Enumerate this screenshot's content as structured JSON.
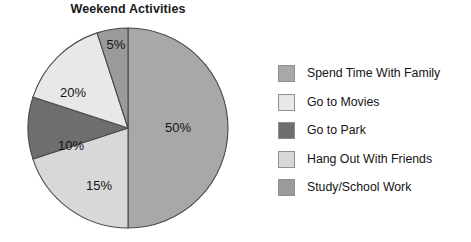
{
  "chart_data": {
    "type": "pie",
    "title": "Weekend Activities",
    "xlabel": "",
    "ylabel": "",
    "legend_position": "right",
    "grid": false,
    "categories": [
      "Spend Time With Family",
      "Go to Movies",
      "Go to Park",
      "Hang Out With Friends",
      "Study/School Work"
    ],
    "values": [
      50,
      15,
      10,
      20,
      5
    ],
    "value_labels": [
      "50%",
      "15%",
      "10%",
      "20%",
      "5%"
    ],
    "colors": [
      "#a8a8a8",
      "#e8e8e8",
      "#6e6e6e",
      "#d8d8d8",
      "#9a9a9a"
    ],
    "slice_order_clockwise_from_top": [
      "Spend Time With Family",
      "Hang Out With Friends",
      "Go to Park",
      "Go to Movies",
      "Study/School Work"
    ],
    "slices": [
      {
        "label": "Spend Time With Family",
        "value": 50,
        "display": "50%",
        "color": "#a8a8a8"
      },
      {
        "label": "Go to Movies",
        "value": 15,
        "display": "15%",
        "color": "#e8e8e8"
      },
      {
        "label": "Go to Park",
        "value": 10,
        "display": "10%",
        "color": "#6e6e6e"
      },
      {
        "label": "Hang Out With Friends",
        "value": 20,
        "display": "20%",
        "color": "#d8d8d8"
      },
      {
        "label": "Study/School Work",
        "value": 5,
        "display": "5%",
        "color": "#9a9a9a"
      }
    ]
  },
  "legend": {
    "items": [
      {
        "label": "Spend Time With Family",
        "color": "#a8a8a8"
      },
      {
        "label": "Go to Movies",
        "color": "#e8e8e8"
      },
      {
        "label": "Go to Park",
        "color": "#6e6e6e"
      },
      {
        "label": "Hang Out With Friends",
        "color": "#d8d8d8"
      },
      {
        "label": "Study/School Work",
        "color": "#9a9a9a"
      }
    ]
  },
  "slice_label_positions": [
    {
      "display": "50%",
      "x": 178,
      "y": 132
    },
    {
      "display": "15%",
      "x": 99,
      "y": 190
    },
    {
      "display": "10%",
      "x": 71,
      "y": 150
    },
    {
      "display": "20%",
      "x": 73,
      "y": 97
    },
    {
      "display": "5%",
      "x": 116,
      "y": 49
    }
  ],
  "geometry": {
    "cx": 128,
    "cy": 128,
    "r": 100
  }
}
